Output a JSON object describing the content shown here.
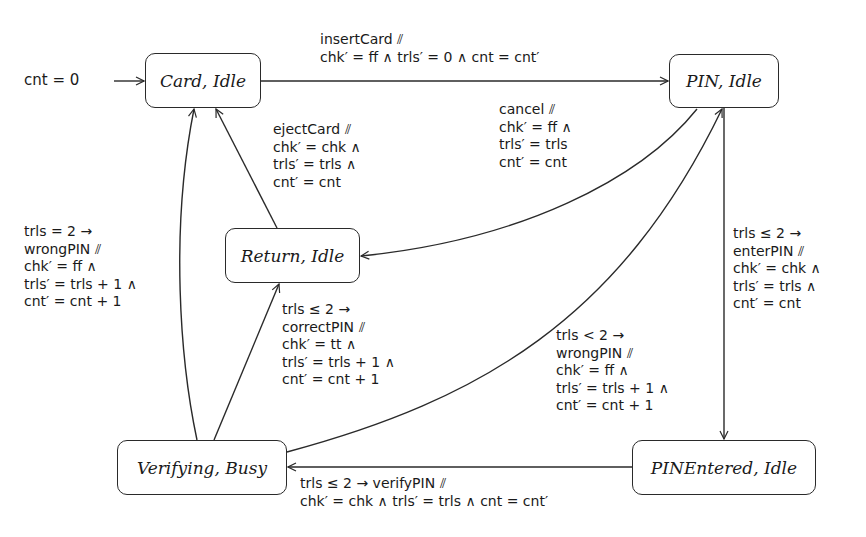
{
  "diagram": {
    "type": "state-machine",
    "initial": {
      "label": "cnt = 0 ⟶",
      "target": "card_idle"
    },
    "states": {
      "card_idle": "Card, Idle",
      "pin_idle": "PIN, Idle",
      "return_idle": "Return, Idle",
      "verifying_busy": "Verifying, Busy",
      "pinentered_idle": "PINEntered, Idle"
    },
    "transitions": {
      "insert_card": {
        "from": "card_idle",
        "to": "pin_idle",
        "lines": [
          "insertCard ⫽",
          "chk′ = ff ∧ trls′ = 0 ∧ cnt = cnt′"
        ]
      },
      "cancel": {
        "from": "pin_idle",
        "to": "return_idle",
        "lines": [
          "cancel ⫽",
          "chk′ = ff ∧",
          "trls′ = trls",
          "cnt′ = cnt"
        ]
      },
      "eject_card": {
        "from": "return_idle",
        "to": "card_idle",
        "lines": [
          "ejectCard ⫽",
          "chk′ = chk ∧",
          "trls′ = trls ∧",
          "cnt′ = cnt"
        ]
      },
      "enter_pin": {
        "from": "pin_idle",
        "to": "pinentered_idle",
        "lines": [
          "trls ≤ 2 →",
          "enterPIN ⫽",
          "chk′ = chk ∧",
          "trls′ = trls ∧",
          "cnt′ = cnt"
        ]
      },
      "verify_pin": {
        "from": "pinentered_idle",
        "to": "verifying_busy",
        "lines": [
          "trls ≤ 2 → verifyPIN ⫽",
          "chk′ = chk ∧ trls′ = trls ∧ cnt = cnt′"
        ]
      },
      "correct_pin": {
        "from": "verifying_busy",
        "to": "return_idle",
        "lines": [
          "trls ≤ 2 →",
          "correctPIN ⫽",
          "chk′ = tt ∧",
          "trls′ = trls + 1 ∧",
          "cnt′ = cnt + 1"
        ]
      },
      "wrong_pin_retry": {
        "from": "verifying_busy",
        "to": "pin_idle",
        "lines": [
          "trls < 2 →",
          "wrongPIN ⫽",
          "chk′ = ff ∧",
          "trls′ = trls + 1 ∧",
          "cnt′ = cnt + 1"
        ]
      },
      "wrong_pin_final": {
        "from": "verifying_busy",
        "to": "card_idle",
        "lines": [
          "trls = 2 →",
          "wrongPIN ⫽",
          "chk′ = ff ∧",
          "trls′ = trls + 1 ∧",
          "cnt′ = cnt + 1"
        ]
      }
    },
    "colors": {
      "stroke": "#2a2a2a",
      "text": "#1a1a1a",
      "background": "#ffffff"
    }
  }
}
